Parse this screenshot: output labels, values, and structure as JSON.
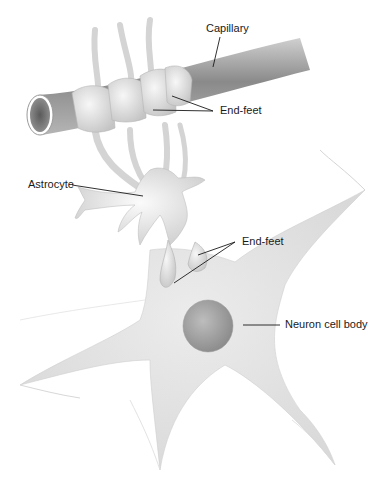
{
  "figure": {
    "labels": {
      "capillary": "Capillary",
      "end_feet_top": "End-feet",
      "astrocyte": "Astrocyte",
      "end_feet_bottom": "End-feet",
      "neuron_cell_body": "Neuron cell body"
    },
    "colors": {
      "background": "#ffffff",
      "leader_line": "#1a1a1a",
      "capillary_dark": "#6e6e6e",
      "capillary_light": "#c8c8c8",
      "cell_fill": "#e6e6e6",
      "nucleus": "#9a9a9a"
    }
  }
}
